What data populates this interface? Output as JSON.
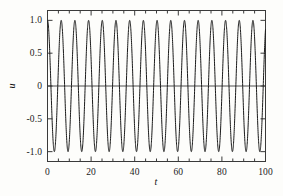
{
  "figure": {
    "background_color": "#fdfdfb",
    "line_color": "#1a1a1a",
    "axis_color": "#3a3a3a"
  },
  "chart_data": {
    "type": "line",
    "title": "",
    "xlabel": "t",
    "ylabel": "u",
    "xlim": [
      0,
      100
    ],
    "ylim": [
      -1.15,
      1.15
    ],
    "grid": false,
    "legend": null,
    "xticks": [
      0,
      20,
      40,
      60,
      80,
      100
    ],
    "xtick_labels": [
      "0",
      "20",
      "40",
      "60",
      "80",
      "100"
    ],
    "xminor_ticks": [
      5,
      10,
      15,
      25,
      30,
      35,
      45,
      50,
      55,
      65,
      70,
      75,
      85,
      90,
      95
    ],
    "yticks": [
      -1.0,
      -0.5,
      0,
      0.5,
      1.0
    ],
    "ytick_labels": [
      "-1.0",
      "-0.5",
      "0",
      "0.5",
      "1.0"
    ],
    "reference_lines": [
      {
        "orientation": "horizontal",
        "value": 0
      }
    ],
    "series": [
      {
        "name": "u(t)",
        "function": "cos",
        "amplitude": 1.0,
        "period": 6.283185307179586,
        "phase": 0,
        "offset": 0,
        "cycles_shown": 15.9,
        "x_start": 0,
        "x_end": 100,
        "samples": 2400
      }
    ]
  }
}
